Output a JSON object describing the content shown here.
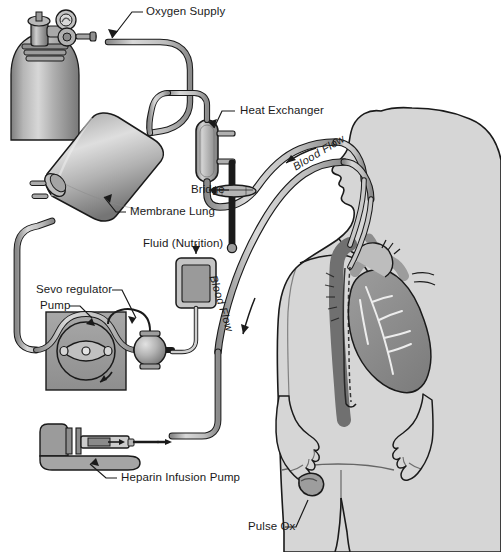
{
  "diagram": {
    "background_color": "#ffffff",
    "line_color": "#1a1a1a",
    "body_fill": "#d6d6d6",
    "metal_fill": "#9a9a9a",
    "tube_fill": "#c9c9c9",
    "organ_fill": "#8e8e8e",
    "vessel_fill": "#707070"
  },
  "labels": {
    "oxygen_supply": "Oxygen Supply",
    "heat_exchanger": "Heat Exchanger",
    "bridge": "Bridge",
    "membrane_lung": "Membrane Lung",
    "fluid_nutrition": "Fluid (Nutrition)",
    "sevo_regulator": "Sevo regulator",
    "pump": "Pump",
    "heparin_infusion_pump": "Heparin Infusion Pump",
    "pulse_ox": "Pulse Ox",
    "blood_flow_upper": "Blood Flow",
    "blood_flow_lower": "Blood Flow"
  },
  "components": [
    {
      "name": "oxygen-tank",
      "label": "Oxygen Supply",
      "type": "gas-cylinder"
    },
    {
      "name": "membrane-lung",
      "label": "Membrane Lung",
      "type": "oxygenator"
    },
    {
      "name": "heat-exchanger",
      "label": "Heat Exchanger",
      "type": "heater"
    },
    {
      "name": "bridge",
      "label": "Bridge",
      "type": "connector-clamp"
    },
    {
      "name": "fluid-bag",
      "label": "Fluid (Nutrition)",
      "type": "iv-bag"
    },
    {
      "name": "servo-regulator",
      "label": "Sevo regulator",
      "type": "bladder"
    },
    {
      "name": "roller-pump",
      "label": "Pump",
      "type": "roller-pump"
    },
    {
      "name": "heparin-pump",
      "label": "Heparin Infusion Pump",
      "type": "syringe-pump"
    },
    {
      "name": "pulse-oximeter",
      "label": "Pulse Ox",
      "type": "sensor"
    },
    {
      "name": "patient",
      "label": "",
      "type": "human-figure"
    },
    {
      "name": "heart",
      "label": "",
      "type": "organ"
    }
  ]
}
